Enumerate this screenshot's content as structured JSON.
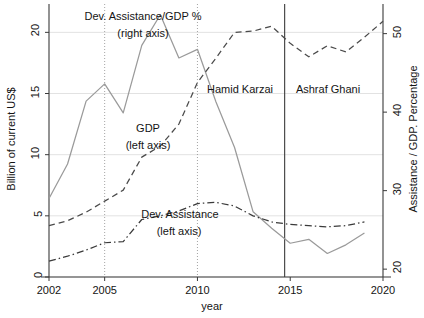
{
  "chart_data": {
    "type": "line",
    "title": "",
    "xlabel": "year",
    "ylabel": "Billion of current US$",
    "ylabel_right": "Assistance / GDP. Percentage",
    "xlim": [
      2002,
      2020
    ],
    "ylim_left": [
      0,
      21.5
    ],
    "ylim_right": [
      19,
      52.5
    ],
    "xticks": [
      2002,
      2005,
      2010,
      2015,
      2020
    ],
    "xtick_labels": [
      "2002",
      "2005",
      "2010",
      "2015",
      "2020"
    ],
    "yticks_left": [
      0,
      5,
      10,
      15,
      20
    ],
    "ytick_labels_left": [
      "0",
      "5",
      "10",
      "15",
      "20"
    ],
    "yticks_right": [
      20,
      30,
      40,
      50
    ],
    "ytick_labels_right": [
      "20",
      "30",
      "40",
      "50"
    ],
    "grid": "horizontal-light",
    "legend_position": "inline-annotations",
    "series": [
      {
        "name": "Dev. Assistance/GDP %",
        "axis": "right",
        "style": "solid",
        "color": "#9a9a9a",
        "x": [
          2002,
          2003,
          2004,
          2005,
          2006,
          2007,
          2008,
          2009,
          2010,
          2011,
          2012,
          2013,
          2014,
          2015,
          2016,
          2017,
          2018,
          2019
        ],
        "values": [
          29.0,
          33.4,
          41.4,
          43.6,
          39.9,
          48.5,
          52.4,
          46.9,
          48.0,
          41.3,
          35.5,
          27.3,
          25.2,
          23.3,
          23.8,
          22.0,
          23.1,
          24.6
        ]
      },
      {
        "name": "GDP",
        "axis": "left",
        "style": "dashed",
        "color": "#4a4a4a",
        "x": [
          2002,
          2003,
          2004,
          2005,
          2006,
          2007,
          2008,
          2009,
          2010,
          2011,
          2012,
          2013,
          2014,
          2015,
          2016,
          2017,
          2018,
          2019,
          2020
        ],
        "values": [
          4.2,
          4.6,
          5.3,
          6.2,
          7.1,
          9.8,
          10.7,
          12.5,
          15.9,
          17.9,
          20.0,
          20.1,
          20.5,
          19.1,
          18.0,
          18.9,
          18.4,
          19.6,
          20.9
        ]
      },
      {
        "name": "Dev. Assistance",
        "axis": "left",
        "style": "dash-dot",
        "color": "#3a3a3a",
        "x": [
          2002,
          2003,
          2004,
          2005,
          2006,
          2007,
          2008,
          2009,
          2010,
          2011,
          2012,
          2013,
          2014,
          2015,
          2016,
          2017,
          2018,
          2019
        ],
        "values": [
          1.3,
          1.7,
          2.2,
          2.8,
          2.9,
          4.7,
          5.0,
          5.4,
          6.0,
          6.1,
          5.8,
          5.0,
          4.5,
          4.3,
          4.2,
          4.1,
          4.2,
          4.5
        ]
      }
    ],
    "vlines": [
      {
        "x": 2005,
        "style": "dotted",
        "color": "#9a9a9a"
      },
      {
        "x": 2010,
        "style": "dotted",
        "color": "#9a9a9a"
      },
      {
        "x": 2014.7,
        "style": "solid",
        "color": "#3a3a3a"
      }
    ],
    "annotations": [
      {
        "id": "solid-series-label-line1",
        "text": "Dev. Assistance/GDP %"
      },
      {
        "id": "solid-series-label-line2",
        "text": "(right axis)"
      },
      {
        "id": "gdp-series-label-line1",
        "text": "GDP"
      },
      {
        "id": "gdp-series-label-line2",
        "text": "(left axis)"
      },
      {
        "id": "assistance-series-label-line1",
        "text": "Dev. Assistance"
      },
      {
        "id": "assistance-series-label-line2",
        "text": "(left axis)"
      },
      {
        "id": "period-karzai",
        "text": "Hamid Karzai"
      },
      {
        "id": "period-ghani",
        "text": "Ashraf Ghani"
      }
    ]
  }
}
